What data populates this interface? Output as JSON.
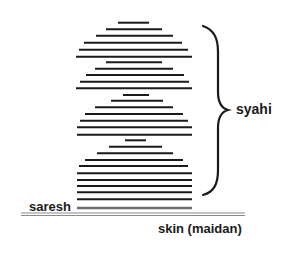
{
  "diagram": {
    "labels": {
      "syahi": "syahi",
      "saresh": "saresh",
      "skin": "skin (maidan)"
    },
    "colors": {
      "ink": "#1a1a1a",
      "saresh": "#6e6e6e",
      "skin": "#8a8a8a"
    },
    "syahi_layers": [
      {
        "y": 22.7,
        "x1": 118,
        "x2": 149
      },
      {
        "y": 29.3,
        "x1": 106,
        "x2": 162
      },
      {
        "y": 35.7,
        "x1": 96,
        "x2": 173
      },
      {
        "y": 42.7,
        "x1": 84,
        "x2": 182
      },
      {
        "y": 49.7,
        "x1": 79,
        "x2": 188
      },
      {
        "y": 56.7,
        "x1": 76,
        "x2": 192
      },
      {
        "y": 62.3,
        "x1": 106,
        "x2": 162
      },
      {
        "y": 68.7,
        "x1": 95,
        "x2": 173
      },
      {
        "y": 75.0,
        "x1": 86,
        "x2": 184
      },
      {
        "y": 81.7,
        "x1": 80,
        "x2": 189
      },
      {
        "y": 88.3,
        "x1": 76,
        "x2": 192
      },
      {
        "y": 95.0,
        "x1": 123,
        "x2": 149
      },
      {
        "y": 100.7,
        "x1": 111,
        "x2": 163
      },
      {
        "y": 107.3,
        "x1": 95,
        "x2": 173
      },
      {
        "y": 114.0,
        "x1": 85,
        "x2": 183
      },
      {
        "y": 120.7,
        "x1": 80,
        "x2": 188
      },
      {
        "y": 127.3,
        "x1": 77,
        "x2": 192
      },
      {
        "y": 134.7,
        "x1": 77,
        "x2": 192
      },
      {
        "y": 140.3,
        "x1": 125,
        "x2": 146
      },
      {
        "y": 146.7,
        "x1": 109,
        "x2": 162
      },
      {
        "y": 153.3,
        "x1": 97,
        "x2": 173
      },
      {
        "y": 160.0,
        "x1": 85,
        "x2": 183
      },
      {
        "y": 166.0,
        "x1": 79,
        "x2": 188
      },
      {
        "y": 173.3,
        "x1": 77,
        "x2": 192
      },
      {
        "y": 180.0,
        "x1": 77,
        "x2": 192
      },
      {
        "y": 186.0,
        "x1": 77,
        "x2": 192
      },
      {
        "y": 192.3,
        "x1": 77,
        "x2": 192
      },
      {
        "y": 199.3,
        "x1": 77,
        "x2": 192
      }
    ],
    "saresh_layer": {
      "y": 208,
      "x1": 77,
      "x2": 192
    },
    "skin_lines": [
      {
        "y": 213,
        "x1": 21,
        "x2": 245
      },
      {
        "y": 215.5,
        "x1": 21,
        "x2": 245
      }
    ]
  }
}
